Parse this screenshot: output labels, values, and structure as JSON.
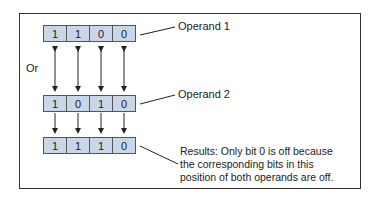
{
  "operand1": {
    "label": "Operand 1",
    "bits": [
      "1",
      "1",
      "0",
      "0"
    ]
  },
  "operand2": {
    "label": "Operand 2",
    "bits": [
      "1",
      "0",
      "1",
      "0"
    ]
  },
  "result": {
    "bits": [
      "1",
      "1",
      "1",
      "0"
    ],
    "note": "Results: Only bit 0 is off because the corresponding bits in this position of both operands are off."
  },
  "operator_label": "Or",
  "colors": {
    "cell_fill": "#c8d6e8",
    "border": "#555555"
  }
}
